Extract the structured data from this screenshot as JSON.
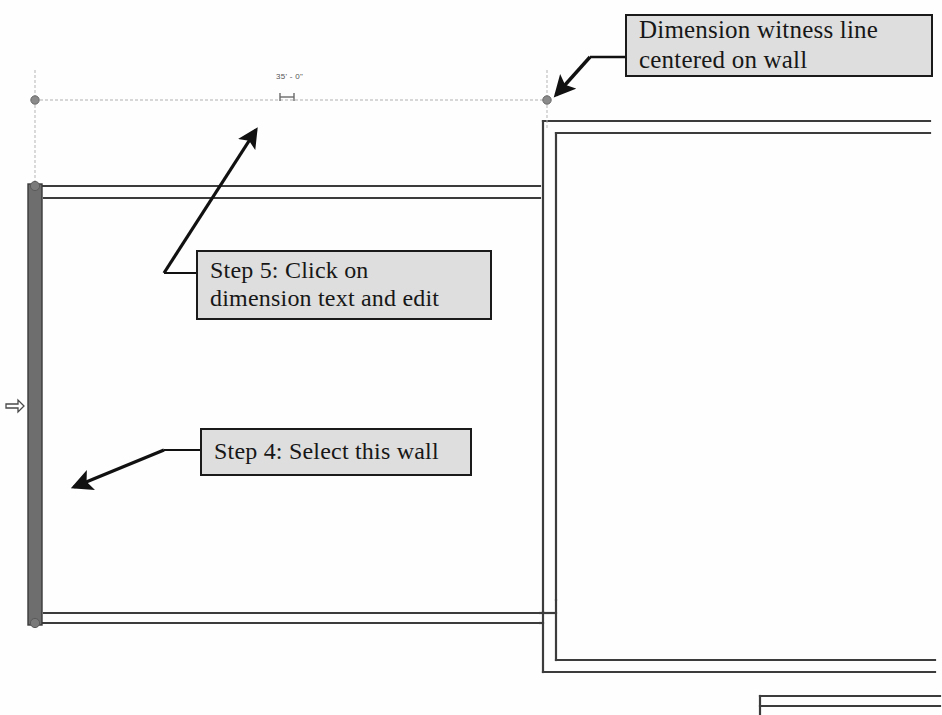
{
  "drawing": {
    "title": "Revit floor plan wall dimension edit",
    "background_color": "#fefefe",
    "wall_line_color": "#3c3c3c",
    "selected_wall_color": "#6e6e6e",
    "dimension_line_color": "#a8a8a8",
    "grip_color": "#8a8a8a",
    "annotation_arrow_color": "#111111",
    "callout_fill": "#dedede",
    "callout_border": "#1a1a1a"
  },
  "dimensions": {
    "horizontal": {
      "value": "35' - 0\"",
      "line_y": 100,
      "x_start": 35,
      "x_end": 547,
      "tick_symbol": "H-tick"
    },
    "vertical": {
      "value": "",
      "symbol": "dimension-flip-control"
    }
  },
  "callouts": [
    {
      "name": "witness-line-callout",
      "text": "Dimension witness line\ncentered on wall",
      "target": "dimension endpoint grip on wall"
    },
    {
      "name": "step-5-callout",
      "text": "Step 5: Click on\ndimension text and edit",
      "target": "dimension text"
    },
    {
      "name": "step-4-callout",
      "text": "Step 4: Select this wall",
      "target": "left exterior wall"
    }
  ]
}
